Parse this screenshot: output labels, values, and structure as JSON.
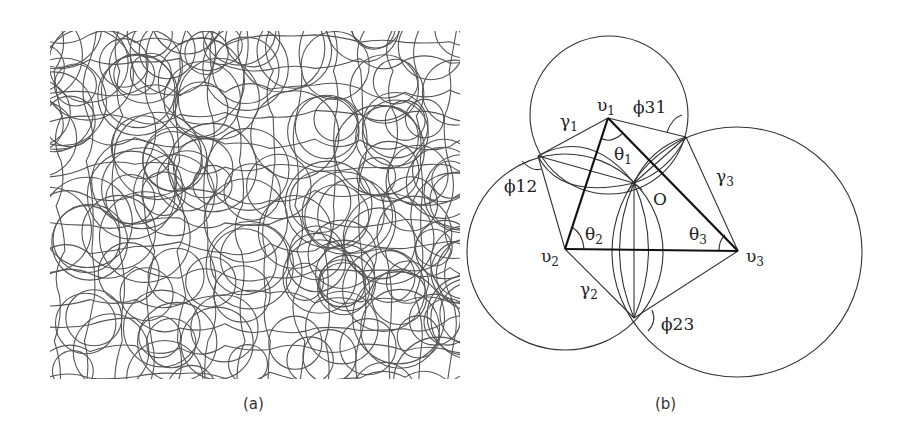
{
  "figure": {
    "panels": [
      {
        "id": "a",
        "caption": "(a)",
        "description": "Dense mesh of overlapping circles and curved lines forming a network pattern"
      },
      {
        "id": "b",
        "caption": "(b)",
        "vertices": {
          "v1": {
            "label": "υ",
            "sub": "1",
            "x": 608,
            "y": 118
          },
          "v2": {
            "label": "υ",
            "sub": "2",
            "x": 565,
            "y": 249
          },
          "v3": {
            "label": "υ",
            "sub": "3",
            "x": 738,
            "y": 251
          }
        },
        "circles": [
          {
            "name": "circle-v1",
            "cx": 609,
            "cy": 115,
            "r": 79
          },
          {
            "name": "circle-v2",
            "cx": 565,
            "cy": 252,
            "r": 98
          },
          {
            "name": "circle-v3",
            "cx": 737,
            "cy": 252,
            "r": 125
          }
        ],
        "intersections": {
          "p12": {
            "x": 538,
            "y": 156
          },
          "p31": {
            "x": 686,
            "y": 137
          },
          "p23": {
            "x": 634,
            "y": 318
          },
          "O": {
            "x": 634,
            "y": 183
          }
        },
        "labels": {
          "gamma1": {
            "text": "γ",
            "sub": "1"
          },
          "gamma2": {
            "text": "γ",
            "sub": "2"
          },
          "gamma3": {
            "text": "γ",
            "sub": "3"
          },
          "theta1": {
            "text": "θ",
            "sub": "1"
          },
          "theta2": {
            "text": "θ",
            "sub": "2"
          },
          "theta3": {
            "text": "θ",
            "sub": "3"
          },
          "phi12": "ϕ12",
          "phi31": "ϕ31",
          "phi23": "ϕ23",
          "center": "O"
        }
      }
    ]
  }
}
